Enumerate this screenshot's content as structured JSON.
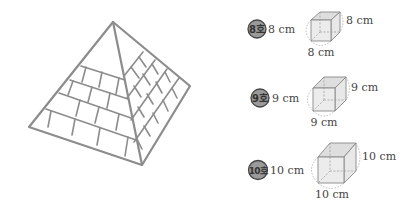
{
  "pyramid": {
    "stroke_color": "#8c8c8c",
    "fill_color": "#ffffff"
  },
  "cubes": [
    {
      "badge": "8호",
      "left_label": "8 cm",
      "right_label": "8 cm",
      "bottom_label": "8 cm"
    },
    {
      "badge": "9호",
      "left_label": "9 cm",
      "right_label": "9 cm",
      "bottom_label": "9 cm"
    },
    {
      "badge": "10호",
      "left_label": "10 cm",
      "right_label": "10 cm",
      "bottom_label": "10 cm"
    }
  ],
  "colors": {
    "badge_fill": "#9a9a9a",
    "badge_stroke": "#444444",
    "cube_fill": "#e6e6e6",
    "cube_stroke": "#888888",
    "dotted": "#aaaaaa"
  }
}
